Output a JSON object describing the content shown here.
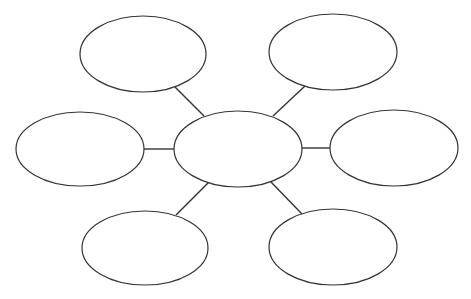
{
  "diagram": {
    "type": "bubble-map",
    "background": "#ffffff",
    "stroke_color": "#333333",
    "center": {
      "id": "center",
      "cx": 238,
      "cy": 149,
      "rx": 64,
      "ry": 38,
      "label": ""
    },
    "nodes": [
      {
        "id": "top-left",
        "cx": 143,
        "cy": 54,
        "rx": 63,
        "ry": 38,
        "label": ""
      },
      {
        "id": "top-right",
        "cx": 333,
        "cy": 52,
        "rx": 64,
        "ry": 38,
        "label": ""
      },
      {
        "id": "left",
        "cx": 80,
        "cy": 149,
        "rx": 64,
        "ry": 37,
        "label": ""
      },
      {
        "id": "right",
        "cx": 394,
        "cy": 148,
        "rx": 64,
        "ry": 38,
        "label": ""
      },
      {
        "id": "bottom-left",
        "cx": 145,
        "cy": 248,
        "rx": 63,
        "ry": 37,
        "label": ""
      },
      {
        "id": "bottom-right",
        "cx": 333,
        "cy": 247,
        "rx": 64,
        "ry": 38,
        "label": ""
      }
    ],
    "connectors": [
      {
        "from": "top-left",
        "x1": 175,
        "y1": 87,
        "x2": 204,
        "y2": 116
      },
      {
        "from": "top-right",
        "x1": 305,
        "y1": 86,
        "x2": 273,
        "y2": 116
      },
      {
        "from": "left",
        "x1": 144,
        "y1": 149,
        "x2": 174,
        "y2": 149
      },
      {
        "from": "right",
        "x1": 301,
        "y1": 148,
        "x2": 330,
        "y2": 148
      },
      {
        "from": "bottom-left",
        "x1": 176,
        "y1": 215,
        "x2": 209,
        "y2": 182
      },
      {
        "from": "bottom-right",
        "x1": 302,
        "y1": 214,
        "x2": 270,
        "y2": 181
      }
    ]
  }
}
